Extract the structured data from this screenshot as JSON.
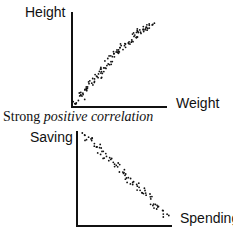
{
  "chart_data": [
    {
      "type": "scatter",
      "title": "",
      "caption": "Strong positive correlation",
      "xlabel": "Weight",
      "ylabel": "Height",
      "grid": false,
      "trend": "positive",
      "x": [
        0.02,
        0.04,
        0.06,
        0.08,
        0.1,
        0.12,
        0.14,
        0.16,
        0.18,
        0.2,
        0.22,
        0.24,
        0.26,
        0.28,
        0.3,
        0.32,
        0.34,
        0.36,
        0.38,
        0.4,
        0.42,
        0.44,
        0.46,
        0.48,
        0.5,
        0.52,
        0.54,
        0.56,
        0.58,
        0.6,
        0.62,
        0.64,
        0.66,
        0.68,
        0.7,
        0.72,
        0.74,
        0.76,
        0.78,
        0.8,
        0.82
      ],
      "y": [
        0.03,
        0.06,
        0.1,
        0.12,
        0.16,
        0.18,
        0.22,
        0.25,
        0.27,
        0.3,
        0.33,
        0.36,
        0.38,
        0.41,
        0.44,
        0.46,
        0.49,
        0.52,
        0.54,
        0.57,
        0.6,
        0.62,
        0.65,
        0.68,
        0.7,
        0.72,
        0.75,
        0.77,
        0.8,
        0.82,
        0.84,
        0.86,
        0.88,
        0.9,
        0.91,
        0.92,
        0.93,
        0.94,
        0.95,
        0.96,
        0.97
      ]
    },
    {
      "type": "scatter",
      "title": "",
      "caption": "",
      "xlabel": "Spending",
      "ylabel": "Saving",
      "grid": false,
      "trend": "negative",
      "x": [
        0.05,
        0.08,
        0.11,
        0.14,
        0.17,
        0.2,
        0.23,
        0.26,
        0.29,
        0.32,
        0.35,
        0.38,
        0.41,
        0.44,
        0.47,
        0.5,
        0.53,
        0.56,
        0.59,
        0.62,
        0.65,
        0.68,
        0.71,
        0.74,
        0.77,
        0.8,
        0.83,
        0.86
      ],
      "y": [
        0.92,
        0.89,
        0.86,
        0.83,
        0.8,
        0.77,
        0.74,
        0.71,
        0.68,
        0.65,
        0.62,
        0.59,
        0.56,
        0.53,
        0.5,
        0.47,
        0.44,
        0.41,
        0.38,
        0.35,
        0.32,
        0.29,
        0.26,
        0.23,
        0.2,
        0.17,
        0.14,
        0.11
      ]
    }
  ],
  "top_chart": {
    "y_label": "Height",
    "x_label": "Weight",
    "caption_prefix": "Strong ",
    "caption_italic": "positive correlation"
  },
  "bottom_chart": {
    "y_label": "Saving",
    "x_label": "Spending"
  }
}
